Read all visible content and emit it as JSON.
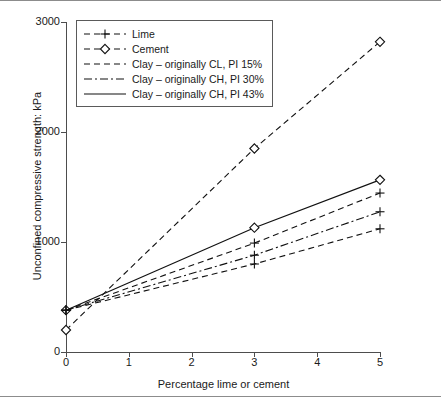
{
  "figure": {
    "rule_top": "",
    "rule_bottom": ""
  },
  "axes": {
    "y_title": "Unconfined compressive strength: kPa",
    "x_title": "Percentage lime or cement",
    "y_ticks": [
      "0",
      "1000",
      "2000",
      "3000"
    ],
    "x_ticks": [
      "0",
      "1",
      "2",
      "3",
      "4",
      "5"
    ]
  },
  "legend": {
    "entries": [
      {
        "label": "Lime",
        "style": "dashed-plus",
        "marker": "plus"
      },
      {
        "label": "Cement",
        "style": "dashed-diamond",
        "marker": "diamond"
      },
      {
        "label": "Clay – originally CL, PI 15%",
        "style": "dashed",
        "marker": "none"
      },
      {
        "label": "Clay – originally CH, PI 30%",
        "style": "dashdot",
        "marker": "none"
      },
      {
        "label": "Clay – originally CH, PI 43%",
        "style": "solid",
        "marker": "none"
      }
    ]
  },
  "chart_data": {
    "type": "line",
    "title": "",
    "xlabel": "Percentage lime or cement",
    "ylabel": "Unconfined compressive strength: kPa",
    "xlim": [
      0,
      5
    ],
    "ylim": [
      0,
      3000
    ],
    "xticks": [
      0,
      1,
      2,
      3,
      4,
      5
    ],
    "yticks": [
      0,
      1000,
      2000,
      3000
    ],
    "grid": false,
    "legend_position": "upper-left-inside",
    "series": [
      {
        "name": "Cement",
        "style": "dashed",
        "marker": "diamond",
        "x": [
          0,
          3,
          5
        ],
        "y": [
          200,
          1850,
          2820
        ]
      },
      {
        "name": "Clay – originally CH, PI 43%",
        "style": "solid",
        "marker": "diamond",
        "x": [
          0,
          3,
          5
        ],
        "y": [
          380,
          1130,
          1565
        ]
      },
      {
        "name": "Lime",
        "style": "dashed",
        "marker": "plus",
        "x": [
          0,
          3,
          5
        ],
        "y": [
          380,
          990,
          1445
        ]
      },
      {
        "name": "Clay – originally CH, PI 30%",
        "style": "dashdot",
        "marker": "plus",
        "x": [
          0,
          3,
          5
        ],
        "y": [
          380,
          880,
          1275
        ]
      },
      {
        "name": "Clay – originally CL, PI 15%",
        "style": "dashed",
        "marker": "plus",
        "x": [
          0,
          3,
          5
        ],
        "y": [
          380,
          800,
          1120
        ]
      }
    ],
    "annotations": [
      {
        "text": "Cement at 0% ≈ 200 kPa",
        "x": 0,
        "y": 200
      },
      {
        "text": "Lime / clay baseline at 0% ≈ 380 kPa",
        "x": 0,
        "y": 380
      }
    ]
  }
}
